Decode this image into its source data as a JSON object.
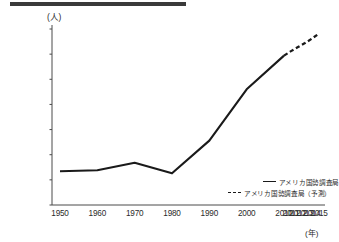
{
  "figure": {
    "y_axis_unit": "(人)",
    "x_axis_unit": "(年)"
  },
  "legend": {
    "items": [
      {
        "label": "アメリカ国勢調査局",
        "style": "solid",
        "icon": "solid-line-swatch"
      },
      {
        "label": "アメリカ国勢調査局（予測）",
        "style": "dashed",
        "icon": "dashed-line-swatch"
      }
    ]
  },
  "chart_data": {
    "type": "line",
    "title": "",
    "subtitle": "",
    "xlabel": "(年)",
    "ylabel": "(人)",
    "grid": false,
    "legend_position": "bottom-right",
    "categories": [
      "1950",
      "1960",
      "1970",
      "1980",
      "1990",
      "2000",
      "2010",
      "2011",
      "2012",
      "2013",
      "2014",
      "2015"
    ],
    "xtick_labels": [
      "1950",
      "1960",
      "1970",
      "1980",
      "1990",
      "2000",
      "2010",
      "2011",
      "2012",
      "2013",
      "2014",
      "2015"
    ],
    "ytick_labels": [
      "300,000",
      "350,000",
      "400,000",
      "450,000",
      "500,000",
      "550,000",
      "600,000",
      "650,000"
    ],
    "ytick_values": [
      300000,
      350000,
      400000,
      450000,
      500000,
      550000,
      600000,
      650000
    ],
    "ylim": [
      300000,
      650000
    ],
    "series": [
      {
        "name": "アメリカ国勢調査局",
        "style": "solid",
        "x": [
          "1950",
          "1960",
          "1970",
          "1980",
          "1990",
          "2000",
          "2010"
        ],
        "values": [
          367000,
          369000,
          384000,
          363000,
          428000,
          530000,
          597000
        ]
      },
      {
        "name": "アメリカ国勢調査局（予測）",
        "style": "dashed",
        "x": [
          "2010",
          "2011",
          "2012",
          "2013",
          "2014",
          "2015"
        ],
        "values": [
          597000,
          606000,
          614000,
          622000,
          631000,
          641000
        ]
      }
    ]
  },
  "colors": {
    "line": "#1a1a1a",
    "axis": "#4a4a4a",
    "topbar": "#3a3a3a",
    "text": "#2b2b2b"
  }
}
